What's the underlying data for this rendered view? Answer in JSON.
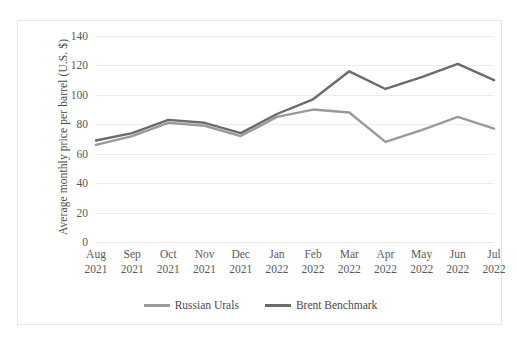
{
  "chart_data": {
    "type": "line",
    "title": "",
    "xlabel": "",
    "ylabel": "Average monthly price per barrel (U.S. $)",
    "categories": [
      "Aug 2021",
      "Sep 2021",
      "Oct 2021",
      "Nov 2021",
      "Dec 2021",
      "Jan 2022",
      "Feb 2022",
      "Mar 2022",
      "Apr 2022",
      "May 2022",
      "Jun 2022",
      "Jul 2022"
    ],
    "category_lines": [
      [
        "Aug",
        "2021"
      ],
      [
        "Sep",
        "2021"
      ],
      [
        "Oct",
        "2021"
      ],
      [
        "Nov",
        "2021"
      ],
      [
        "Dec",
        "2021"
      ],
      [
        "Jan",
        "2022"
      ],
      [
        "Feb",
        "2022"
      ],
      [
        "Mar",
        "2022"
      ],
      [
        "Apr",
        "2022"
      ],
      [
        "May",
        "2022"
      ],
      [
        "Jun",
        "2022"
      ],
      [
        "Jul",
        "2022"
      ]
    ],
    "series": [
      {
        "name": "Russian Urals",
        "color": "#9a9a9a",
        "values": [
          66,
          72,
          81,
          79,
          72,
          85,
          90,
          88,
          68,
          76,
          85,
          77
        ]
      },
      {
        "name": "Brent Benchmark",
        "color": "#6b6b6b",
        "values": [
          69,
          74,
          83,
          81,
          74,
          87,
          97,
          116,
          104,
          112,
          121,
          110
        ]
      }
    ],
    "ylim": [
      0,
      140
    ],
    "ytick_step": 20,
    "yticks": [
      140,
      120,
      100,
      80,
      60,
      40,
      20,
      0
    ],
    "grid": true,
    "legend_position": "bottom-center"
  },
  "colors": {
    "russian_urals": "#9a9a9a",
    "brent_benchmark": "#6b6b6b",
    "gridline": "#ededed",
    "frame": "#e6e6e6",
    "text": "#5a5a5a"
  }
}
